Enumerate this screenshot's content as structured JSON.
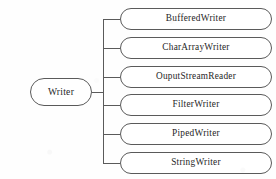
{
  "diagram": {
    "type": "class-hierarchy-tree",
    "background_color": "#fefefe",
    "stroke_color": "#5a5a5a",
    "text_color": "#262626",
    "root": {
      "label": "Writer"
    },
    "children": [
      {
        "label": "BufferedWriter"
      },
      {
        "label": "CharArrayWriter"
      },
      {
        "label": "OuputStreamReader"
      },
      {
        "label": "FilterWriter"
      },
      {
        "label": "PipedWriter"
      },
      {
        "label": "StringWriter"
      }
    ]
  }
}
